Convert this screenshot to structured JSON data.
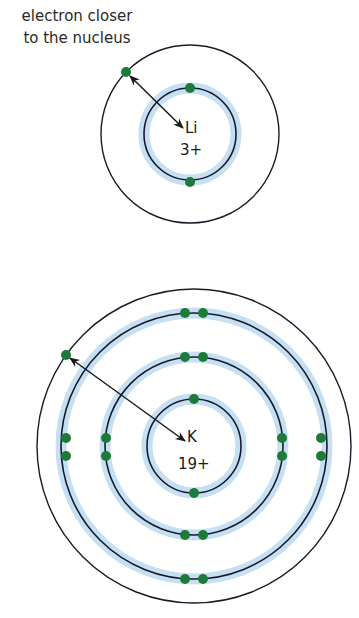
{
  "caption": {
    "line1": "electron closer",
    "line2": "to the nucleus"
  },
  "colors": {
    "orbit": "#1a1a2a",
    "halo": "#c5e0f2",
    "electron": "#1e7a3a",
    "arrow": "#1a1a1a",
    "text": "#1a1a1a"
  },
  "atoms": [
    {
      "name": "lithium",
      "symbol": "Li",
      "charge": "3+",
      "center": [
        190,
        134
      ],
      "shells": [
        {
          "radius": 46,
          "electrons": 2,
          "filled": true
        },
        {
          "radius": 89,
          "electrons": 1,
          "filled": false
        }
      ],
      "outer_electron_arrow": {
        "from": [
          126,
          72
        ],
        "to": [
          184,
          129
        ]
      }
    },
    {
      "name": "potassium",
      "symbol": "K",
      "charge": "19+",
      "center": [
        194,
        446
      ],
      "shells": [
        {
          "radius": 47,
          "electrons": 2,
          "filled": true
        },
        {
          "radius": 89,
          "electrons": 8,
          "filled": true
        },
        {
          "radius": 133,
          "electrons": 8,
          "filled": true
        },
        {
          "radius": 157,
          "electrons": 1,
          "filled": false
        }
      ],
      "outer_electron_arrow": {
        "from": [
          66,
          355
        ],
        "to": [
          186,
          442
        ]
      }
    }
  ]
}
